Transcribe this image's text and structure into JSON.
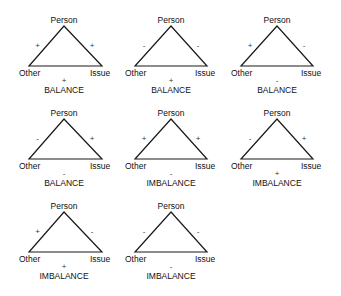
{
  "figure": {
    "vertex_labels": {
      "top": "Person",
      "left": "Other",
      "right": "Issue"
    },
    "triangles": [
      {
        "left_edge": "+",
        "right_edge": "+",
        "base_edge": "+",
        "status": "BALANCE"
      },
      {
        "left_edge": "-",
        "right_edge": "-",
        "base_edge": "+",
        "status": "BALANCE"
      },
      {
        "left_edge": "+",
        "right_edge": "-",
        "base_edge": "-",
        "status": "BALANCE"
      },
      {
        "left_edge": "-",
        "right_edge": "+",
        "base_edge": "-",
        "status": "BALANCE"
      },
      {
        "left_edge": "+",
        "right_edge": "+",
        "base_edge": "-",
        "status": "IMBALANCE"
      },
      {
        "left_edge": "-",
        "right_edge": "+",
        "base_edge": "+",
        "status": "IMBALANCE"
      },
      {
        "left_edge": "+",
        "right_edge": "-",
        "base_edge": "+",
        "status": "IMBALANCE"
      },
      {
        "left_edge": "-",
        "right_edge": "-",
        "base_edge": "-",
        "status": "IMBALANCE"
      }
    ]
  }
}
